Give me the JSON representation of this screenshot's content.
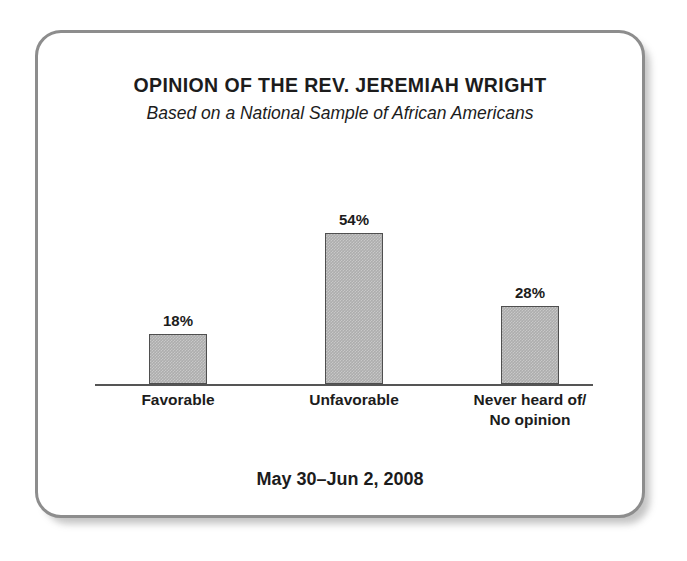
{
  "card": {
    "border_color": "#8d8d8d",
    "background_color": "#ffffff"
  },
  "chart_data": {
    "type": "bar",
    "title": "OPINION OF THE REV. JEREMIAH WRIGHT",
    "subtitle": "Based on a National Sample of African Americans",
    "categories": [
      "Favorable",
      "Unfavorable",
      "Never heard of/\nNo opinion"
    ],
    "category_lines": [
      [
        "Favorable"
      ],
      [
        "Unfavorable"
      ],
      [
        "Never heard of/",
        "No opinion"
      ]
    ],
    "values": [
      18,
      54,
      28
    ],
    "value_labels": [
      "18%",
      "54%",
      "28%"
    ],
    "xlabel": "",
    "ylabel": "",
    "ylim": [
      0,
      70
    ],
    "grid": false,
    "legend": false,
    "axis_visible": "baseline-only",
    "bar_fill_color": "#adadad",
    "bar_border_color": "#4f4f4f",
    "text_color": "#1c1c1c",
    "footnote": "May 30–Jun 2, 2008"
  }
}
